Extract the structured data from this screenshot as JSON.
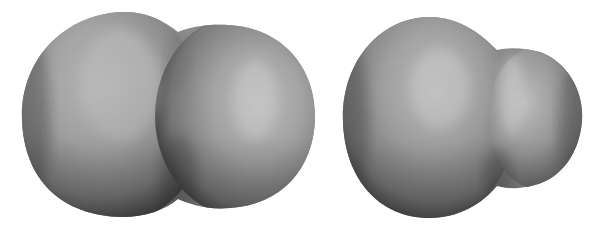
{
  "figure": {
    "background": "#ffffff",
    "surfaces": [
      {
        "name": "symmetric-dumbbell-surface",
        "shape": "two nearly equal overlapping lobes",
        "base_color": "#9a9a9a",
        "highlight_color": "#c4c4c4",
        "shadow_color": "#4a4a4a"
      },
      {
        "name": "asymmetric-surface",
        "shape": "large lobe with smaller lobe on right",
        "base_color": "#9a9a9a",
        "highlight_color": "#c8c8c8",
        "shadow_color": "#4a4a4a"
      }
    ]
  }
}
